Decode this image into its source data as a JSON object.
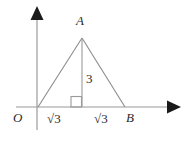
{
  "figure": {
    "colors": {
      "axis": "#9a9a9a",
      "triangle": "#8c8c8c",
      "altitude": "#9a9a9a",
      "arrowhead": "#1a1a1a",
      "right_angle": "#9a9a9a",
      "label": "#2b2b2b",
      "background": "#ffffff"
    },
    "axes": {
      "x_axis_label": "",
      "y_axis_label": "",
      "origin_label": "O"
    },
    "vertices": {
      "apex_label": "A",
      "origin_label": "O",
      "right_label": "B"
    },
    "measurements": {
      "altitude_length": "3",
      "base_left_segment": "√3",
      "base_right_segment": "√3",
      "base_left_radical_sign": "√",
      "base_left_radicand": "3",
      "base_right_radical_sign": "√",
      "base_right_radicand": "3"
    },
    "geometry": {
      "x_axis": {
        "x1": 16,
        "y1": 107,
        "x2": 168,
        "y2": 107
      },
      "y_axis": {
        "x1": 37,
        "y1": 130,
        "x2": 37,
        "y2": 19
      },
      "x_arrowhead": "168,100 181,107 168,114",
      "y_arrowhead": "30,20 37,6 44,20",
      "triangle_points": "38,107 82,38 125,107",
      "altitude": {
        "x1": 82,
        "y1": 38,
        "x2": 82,
        "y2": 107
      },
      "right_angle_marker": {
        "x": 71,
        "y": 96,
        "size": 11
      }
    }
  }
}
